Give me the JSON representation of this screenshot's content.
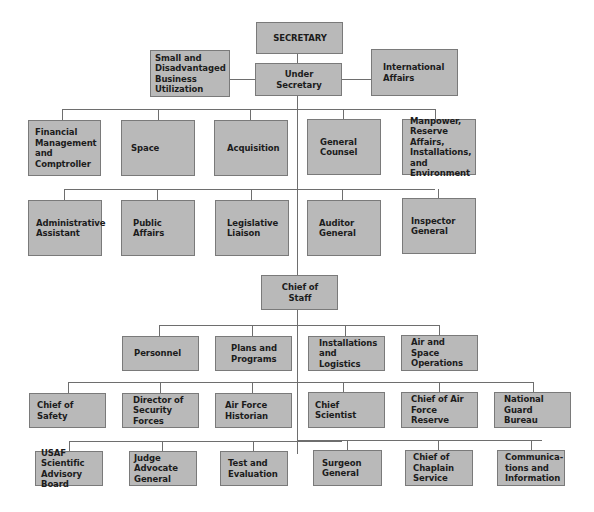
{
  "diagram": {
    "type": "organization-chart",
    "colors": {
      "box_fill": "#b9b9b9",
      "box_border": "#7a7a7a",
      "connector": "#6e6e6e",
      "text": "#1c1c1c"
    },
    "top": {
      "secretary": "SECRETARY",
      "under_secretary": "Under Secretary",
      "small_business": "Small and\nDisadvantaged\nBusiness Utilization",
      "international_affairs": "International\nAffairs"
    },
    "assistant_secretaries": [
      "Financial\nManagement\nand Comptroller",
      "Space",
      "Acquisition",
      "General\nCounsel",
      "Manpower,\nReserve Affairs,\nInstallations, and\nEnvironment"
    ],
    "secretariat_offices": [
      "Administrative\nAssistant",
      "Public\nAffairs",
      "Legislative\nLiaison",
      "Auditor\nGeneral",
      "Inspector\nGeneral"
    ],
    "chief_of_staff": "Chief of Staff",
    "deputy_chiefs": [
      "Personnel",
      "Plans and\nPrograms",
      "Installations\nand Logistics",
      "Air and Space\nOperations"
    ],
    "staff_row_1": [
      "Chief of\nSafety",
      "Director of\nSecurity Forces",
      "Air Force\nHistorian",
      "Chief Scientist",
      "Chief of Air\nForce Reserve",
      "National Guard\nBureau"
    ],
    "staff_row_2": [
      "USAF Scientific\nAdvisory Board",
      "Judge Advocate\nGeneral",
      "Test and\nEvaluation",
      "Surgeon\nGeneral",
      "Chief of\nChaplain\nService",
      "Communica-\ntions and\nInformation"
    ]
  }
}
